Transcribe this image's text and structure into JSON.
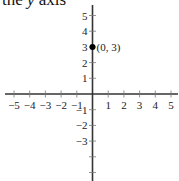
{
  "caption": {
    "prefix": "the ",
    "variable": "y",
    "suffix": " axis"
  },
  "chart_data": {
    "type": "scatter",
    "title": "",
    "xlabel": "",
    "ylabel": "",
    "xlim": [
      -5.5,
      5.5
    ],
    "ylim": [
      -5.5,
      5.5
    ],
    "grid": false,
    "x_ticks": [
      -5,
      -4,
      -3,
      -2,
      -1,
      1,
      2,
      3,
      4,
      5
    ],
    "x_tick_labels": [
      "−5",
      "−4",
      "−3",
      "−2",
      "−1",
      "1",
      "2",
      "3",
      "4",
      "5"
    ],
    "y_ticks": [
      5,
      4,
      3,
      2,
      1,
      -1,
      -2,
      -3,
      -4,
      -5
    ],
    "y_tick_labels": [
      "5",
      "4",
      "3",
      "2",
      "1",
      "−1",
      "−2",
      "−3",
      "",
      ""
    ],
    "points": [
      {
        "x": 0,
        "y": 3,
        "label": "(0, 3)"
      }
    ],
    "colors": {
      "axis": "#333333",
      "point": "#000000"
    }
  }
}
